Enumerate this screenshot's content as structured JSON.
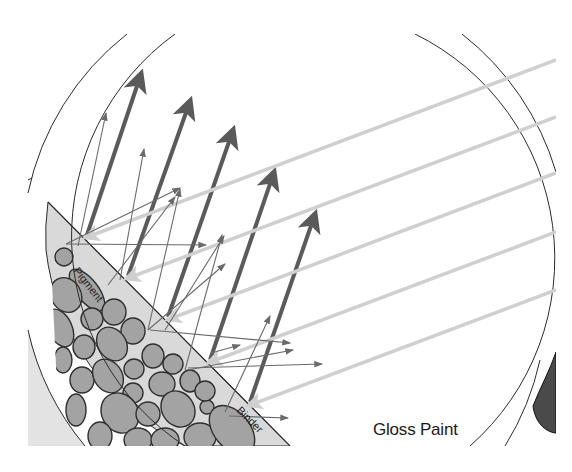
{
  "diagram": {
    "title": "Gloss Paint",
    "labels": {
      "pigment": "Pigment",
      "binder": "Binder"
    },
    "colors": {
      "background": "#ffffff",
      "circle_outline": "#2b2b2b",
      "paint_binder_fill": "#d9d9d9",
      "pigment_fill": "#a3a3a3",
      "pigment_outline": "#2e2e2e",
      "incident_light": "#cfcfcf",
      "specular_reflection": "#5a5a5a",
      "diffuse_reflection": "#6a6a6a",
      "corner_shape": "#4a4a4a"
    },
    "elements": {
      "incident_rays_count": 6,
      "specular_reflected_rays_count": 5,
      "paint_layer": "binder with embedded pigment particles"
    }
  }
}
